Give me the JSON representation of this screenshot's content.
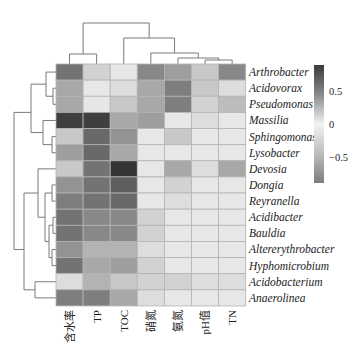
{
  "chart_data": {
    "type": "heatmap",
    "title": "",
    "xlabel": "",
    "ylabel": "",
    "columns": [
      "含水率",
      "TP",
      "TOC",
      "硝氮",
      "氨氮",
      "pH值",
      "TN"
    ],
    "rows": [
      "Arthrobacter",
      "Acidovorax",
      "Pseudomonas",
      "Massilia",
      "Sphingomonas",
      "Lysobacter",
      "Devosia",
      "Dongia",
      "Reyranella",
      "Acidibacter",
      "Bauldia",
      "Altererythrobacter",
      "Hyphomicrobium",
      "Acidobacterium",
      "Anaerolinea"
    ],
    "values": [
      [
        0.6,
        0.15,
        0.05,
        0.5,
        0.4,
        0.2,
        0.5
      ],
      [
        0.35,
        0.05,
        0.1,
        0.35,
        0.55,
        0.2,
        0.1
      ],
      [
        0.35,
        0.05,
        0.2,
        0.35,
        0.55,
        0.15,
        0.25
      ],
      [
        0.85,
        0.85,
        0.35,
        0.4,
        0.05,
        0.1,
        0.05
      ],
      [
        0.2,
        0.65,
        0.45,
        0.05,
        0.2,
        0.05,
        0.05
      ],
      [
        0.4,
        0.65,
        0.35,
        0.05,
        0.05,
        0.05,
        0.05
      ],
      [
        0.2,
        0.6,
        0.9,
        0.05,
        0.35,
        0.1,
        0.35
      ],
      [
        0.45,
        0.6,
        0.7,
        0.05,
        0.15,
        0.05,
        0.05
      ],
      [
        0.55,
        0.6,
        0.65,
        0.05,
        0.1,
        0.05,
        0.05
      ],
      [
        0.6,
        0.5,
        0.5,
        0.15,
        0.05,
        0.05,
        0.05
      ],
      [
        0.6,
        0.5,
        0.5,
        0.15,
        0.05,
        0.05,
        0.05
      ],
      [
        0.45,
        0.3,
        0.3,
        0.1,
        0.05,
        0.05,
        0.05
      ],
      [
        0.6,
        0.35,
        0.4,
        0.15,
        0.05,
        0.05,
        0.05
      ],
      [
        0.1,
        0.3,
        0.2,
        0.15,
        0.15,
        0.1,
        0.1
      ],
      [
        0.55,
        0.55,
        0.35,
        0.1,
        0.05,
        0.05,
        0.05
      ]
    ],
    "note": "Cell values are approximate estimates of grayscale intensity, not values read from the figure. The colormap is diverging and rendered in grayscale, so sign cannot be determined from shade alone; values are stored as non-negative intensity estimates on the colorbar's magnitude scale.",
    "colorbar": {
      "ticks": [
        0.5,
        0,
        -0.5
      ],
      "tick_labels": [
        "0.5",
        "0",
        "−0.5"
      ],
      "range": [
        -0.9,
        0.9
      ]
    },
    "row_dendrogram": "((Arthrobacter,(Acidovorax,Pseudomonas)),(Massilia,(Sphingomonas,Lysobacter))),((Devosia,((Dongia,Reyranella),((Acidibacter,Bauldia),(Altererythrobacter,Hyphomicrobium)))),(Acidobacterium,Anaerolinea))",
    "col_dendrogram": "((含水率,TP),(TOC,(硝氮,(氨氮,(pH值,TN)))))",
    "grid": true,
    "legend_position": "right"
  }
}
